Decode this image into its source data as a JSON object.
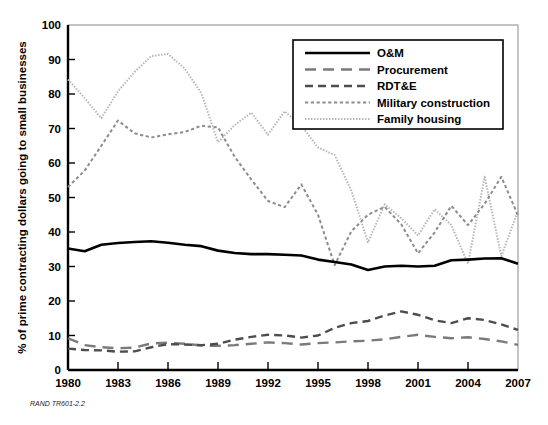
{
  "figure": {
    "footer_note": "RAND TR601-2.2",
    "background_color": "#ffffff"
  },
  "chart_data": {
    "type": "line",
    "title": "",
    "subtitle": "",
    "xlabel": "",
    "ylabel": "% of prime contracting dollars going to small businesses",
    "xlim": [
      1980,
      2007
    ],
    "ylim": [
      0,
      100
    ],
    "grid": false,
    "legend_position": "top-right",
    "xticks": [
      1980,
      1983,
      1986,
      1989,
      1992,
      1995,
      1998,
      2001,
      2004,
      2007
    ],
    "xtick_labels": [
      "1980",
      "1983",
      "1986",
      "1989",
      "1992",
      "1995",
      "1998",
      "2001",
      "2004",
      "2007"
    ],
    "yticks": [
      0,
      10,
      20,
      30,
      40,
      50,
      60,
      70,
      80,
      90,
      100
    ],
    "ytick_labels": [
      "0",
      "10",
      "20",
      "30",
      "40",
      "50",
      "60",
      "70",
      "80",
      "90",
      "100"
    ],
    "x": [
      1980,
      1981,
      1982,
      1983,
      1984,
      1985,
      1986,
      1987,
      1988,
      1989,
      1990,
      1991,
      1992,
      1993,
      1994,
      1995,
      1996,
      1997,
      1998,
      1999,
      2000,
      2001,
      2002,
      2003,
      2004,
      2005,
      2006,
      2007
    ],
    "series": [
      {
        "name": "O&M",
        "style": "solid",
        "color": "#000000",
        "width": 2.6,
        "values": [
          35.2,
          34.4,
          36.3,
          36.8,
          37.1,
          37.3,
          36.9,
          36.3,
          35.9,
          34.6,
          33.9,
          33.6,
          33.6,
          33.4,
          33.2,
          32.0,
          31.3,
          30.6,
          29.0,
          30.0,
          30.2,
          30.0,
          30.2,
          31.8,
          32.0,
          32.3,
          32.4,
          30.8
        ]
      },
      {
        "name": "Procurement",
        "style": "long-dash",
        "color": "#7a7a7a",
        "width": 2.4,
        "values": [
          9.2,
          7.2,
          6.6,
          6.3,
          6.5,
          7.7,
          7.9,
          7.6,
          7.1,
          7.0,
          7.2,
          7.6,
          8.0,
          7.8,
          7.4,
          7.8,
          8.0,
          8.3,
          8.5,
          8.9,
          9.6,
          10.2,
          9.6,
          9.2,
          9.5,
          9.0,
          8.3,
          7.3
        ]
      },
      {
        "name": "RDT&E",
        "style": "dash",
        "color": "#4d4d4d",
        "width": 2.4,
        "values": [
          6.2,
          5.8,
          5.7,
          5.3,
          5.4,
          6.6,
          7.5,
          7.4,
          7.2,
          7.6,
          8.8,
          9.6,
          10.2,
          10.0,
          9.4,
          10.0,
          12.2,
          13.6,
          14.2,
          15.8,
          17.0,
          16.0,
          14.4,
          13.6,
          15.0,
          14.5,
          13.2,
          11.6
        ]
      },
      {
        "name": "Military construction",
        "style": "short-dash",
        "color": "#8c8c8c",
        "width": 2.0,
        "values": [
          53.0,
          57.8,
          65.0,
          72.3,
          68.6,
          67.4,
          68.3,
          69.0,
          70.8,
          70.3,
          61.8,
          55.2,
          49.0,
          47.2,
          53.8,
          45.0,
          30.4,
          40.2,
          45.0,
          47.3,
          42.2,
          33.8,
          39.9,
          47.6,
          42.0,
          48.2,
          56.0,
          44.8
        ]
      },
      {
        "name": "Family housing",
        "style": "dotted",
        "color": "#b3b3b3",
        "width": 2.0,
        "values": [
          84.2,
          78.8,
          73.0,
          80.8,
          86.4,
          91.0,
          91.6,
          87.4,
          80.2,
          66.0,
          71.0,
          74.6,
          68.2,
          75.0,
          70.8,
          64.5,
          62.3,
          52.0,
          37.0,
          48.0,
          44.0,
          39.0,
          46.6,
          42.0,
          30.8,
          56.0,
          33.0,
          46.2
        ]
      }
    ]
  },
  "legend": {
    "entries": [
      {
        "label": "O&M"
      },
      {
        "label": "Procurement"
      },
      {
        "label": "RDT&E"
      },
      {
        "label": "Military construction"
      },
      {
        "label": "Family housing"
      }
    ]
  }
}
